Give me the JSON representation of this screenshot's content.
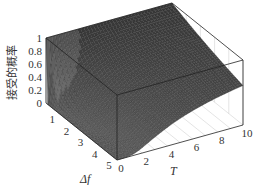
{
  "chart_data": {
    "type": "surface3d",
    "title": "",
    "xlabel": "T",
    "ylabel": "Δf",
    "zlabel": "接受的概率",
    "x_ticks": [
      "0",
      "2",
      "4",
      "6",
      "8",
      "10"
    ],
    "y_ticks": [
      "1",
      "2",
      "3",
      "4",
      "5"
    ],
    "z_ticks": [
      "0",
      "0.2",
      "0.4",
      "0.6",
      "0.8",
      "1"
    ],
    "xlim": [
      0,
      10
    ],
    "ylim": [
      0,
      5
    ],
    "zlim": [
      0,
      1
    ],
    "function": "min(1, exp(-Δf / T))",
    "grid": true,
    "colors": {
      "surface_dark": "#3a3a3a",
      "surface_mid": "#5a5a5a",
      "surface_light": "#8a8a8a",
      "box": "#222222",
      "grid": "#bbbbbb"
    },
    "samples": {
      "T": [
        0,
        2,
        4,
        6,
        8,
        10
      ],
      "df": [
        0,
        1,
        2,
        3,
        4,
        5
      ],
      "z": [
        [
          1,
          1,
          1,
          1,
          1,
          1
        ],
        [
          0,
          0.61,
          0.78,
          0.85,
          0.88,
          0.9
        ],
        [
          0,
          0.37,
          0.61,
          0.72,
          0.78,
          0.82
        ],
        [
          0,
          0.22,
          0.47,
          0.61,
          0.69,
          0.74
        ],
        [
          0,
          0.14,
          0.37,
          0.51,
          0.61,
          0.67
        ],
        [
          0,
          0.08,
          0.29,
          0.43,
          0.54,
          0.61
        ]
      ]
    }
  }
}
